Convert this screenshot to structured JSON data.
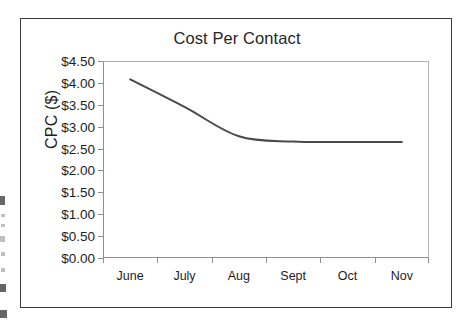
{
  "figure": {
    "title": "Cost Per Contact",
    "border_color": "#3a3a3a",
    "background": "#ffffff"
  },
  "chart_data": {
    "type": "line",
    "title": "Cost Per Contact",
    "xlabel": "",
    "ylabel": "CPC ($)",
    "categories": [
      "June",
      "July",
      "Aug",
      "Sept",
      "Oct",
      "Nov"
    ],
    "series": [
      {
        "name": "CPC ($)",
        "values": [
          4.08,
          3.45,
          2.78,
          2.66,
          2.65,
          2.65
        ],
        "color": "#4a4a4a",
        "line_width": 2,
        "markers": false,
        "smooth": true
      }
    ],
    "ylim": [
      0.0,
      4.5
    ],
    "ytick_values": [
      0.0,
      0.5,
      1.0,
      1.5,
      2.0,
      2.5,
      3.0,
      3.5,
      4.0,
      4.5
    ],
    "ytick_labels": [
      "$0.00",
      "$0.50",
      "$1.00",
      "$1.50",
      "$2.00",
      "$2.50",
      "$3.00",
      "$3.50",
      "$4.00",
      "$4.50"
    ],
    "grid": false,
    "legend": false,
    "axis_color": "#8f8f8f"
  }
}
